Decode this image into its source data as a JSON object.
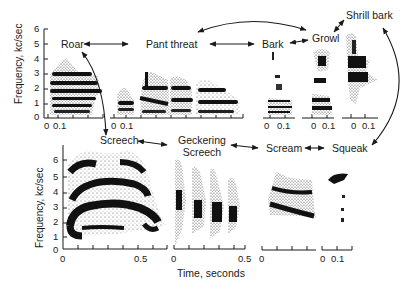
{
  "figure": {
    "top_panel": {
      "y_axis_label": "Frequency, kc/sec",
      "y_ticks": [
        "0",
        "1",
        "2",
        "3",
        "4",
        "5",
        "6"
      ],
      "x_ticks_short": [
        "0",
        "0.1"
      ]
    },
    "bottom_panel": {
      "y_axis_label": "Frequency, kc/sec",
      "y_ticks": [
        "0",
        "1",
        "2",
        "3",
        "4",
        "5",
        "6"
      ],
      "x_ticks": [
        "0",
        "0.5"
      ],
      "x_axis_label": "Time, seconds"
    },
    "calls": [
      {
        "id": "roar",
        "label": "Roar"
      },
      {
        "id": "pant-threat",
        "label": "Pant threat"
      },
      {
        "id": "bark",
        "label": "Bark"
      },
      {
        "id": "growl",
        "label": "Growl"
      },
      {
        "id": "shrill-bark",
        "label": "Shrill bark"
      },
      {
        "id": "screech",
        "label": "Screech"
      },
      {
        "id": "geckering-screech",
        "label": "Geckering Screech"
      },
      {
        "id": "scream",
        "label": "Scream"
      },
      {
        "id": "squeak",
        "label": "Squeak"
      }
    ],
    "geckering_line1": "Geckering",
    "geckering_line2": "Screech",
    "connections": [
      {
        "from": "Roar",
        "to": "Pant threat",
        "type": "bidirectional"
      },
      {
        "from": "Pant threat",
        "to": "Bark",
        "type": "bidirectional"
      },
      {
        "from": "Bark",
        "to": "Growl",
        "type": "bidirectional"
      },
      {
        "from": "Growl",
        "to": "Pant threat",
        "type": "bidirectional-curved"
      },
      {
        "from": "Growl",
        "to": "Shrill bark",
        "type": "bidirectional"
      },
      {
        "from": "Roar",
        "to": "Screech",
        "type": "bidirectional-curved"
      },
      {
        "from": "Screech",
        "to": "Geckering Screech",
        "type": "bidirectional"
      },
      {
        "from": "Geckering Screech",
        "to": "Scream",
        "type": "bidirectional"
      },
      {
        "from": "Scream",
        "to": "Squeak",
        "type": "bidirectional"
      },
      {
        "from": "Shrill bark",
        "to": "Squeak",
        "type": "bidirectional-curved"
      }
    ]
  }
}
